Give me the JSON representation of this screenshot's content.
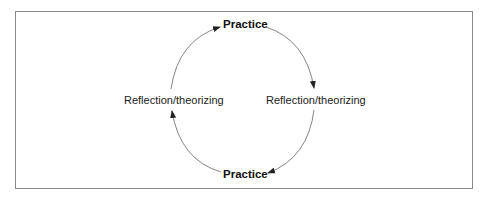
{
  "diagram": {
    "type": "cycle",
    "nodes": [
      {
        "id": "top",
        "label": "Practice",
        "bold": true
      },
      {
        "id": "right",
        "label": "Reflection/theorizing",
        "bold": false
      },
      {
        "id": "bottom",
        "label": "Practice",
        "bold": true
      },
      {
        "id": "left",
        "label": "Reflection/theorizing",
        "bold": false
      }
    ],
    "edges": [
      {
        "from": "top",
        "to": "right"
      },
      {
        "from": "right",
        "to": "bottom"
      },
      {
        "from": "bottom",
        "to": "left"
      },
      {
        "from": "left",
        "to": "top"
      }
    ],
    "direction": "clockwise"
  },
  "colors": {
    "border": "#8a8a8a",
    "arrow": "#555555",
    "text": "#222222"
  }
}
